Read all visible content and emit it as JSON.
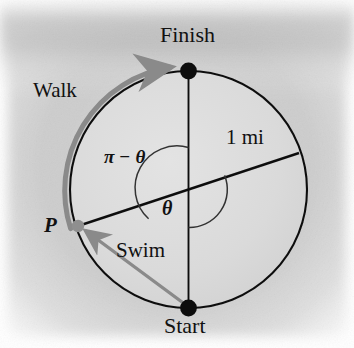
{
  "figure": {
    "background_color": "#c9c9c9",
    "page_color": "#f2f2f2",
    "labels": {
      "finish": "Finish",
      "start": "Start",
      "walk": "Walk",
      "swim": "Swim",
      "radius": "1 mi",
      "point_p": "P",
      "angle_supplement": "π − θ",
      "angle_theta": "θ"
    },
    "colors": {
      "stroke": "#111111",
      "arrow": "#8a8a8a",
      "circle_fill": "#dcdcdc",
      "marker": "#0d0d0d",
      "point_p_marker": "#8f8f8f"
    },
    "geometry": {
      "center": [
        188.5,
        189.5
      ],
      "radius": 118.5,
      "start_point": [
        188.5,
        308.0
      ],
      "finish_point": [
        188.5,
        71.0
      ],
      "point_p": [
        78.0,
        226.0
      ],
      "diameter_end": [
        299.0,
        153.0
      ],
      "angle_theta_deg": 143,
      "arc_upper_radius": 42,
      "arc_lower_radius": 38
    }
  }
}
